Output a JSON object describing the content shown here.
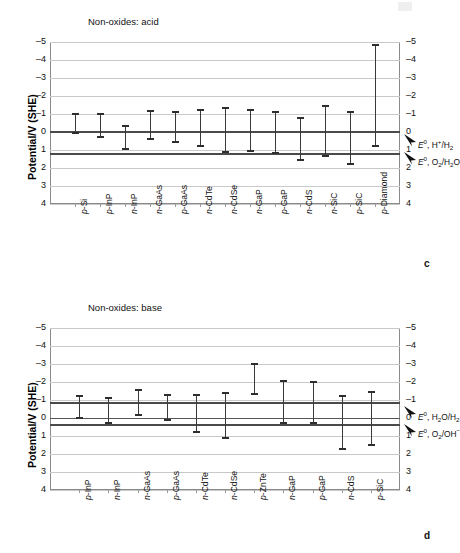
{
  "figure": {
    "panels": [
      "c",
      "d"
    ]
  },
  "panel_c": {
    "letter": "c",
    "title": "Non-oxides: acid",
    "ylabel": "Potential/V (SHE)",
    "annotations": [
      {
        "name": "h-plus-h2",
        "text": "E0, H+/H2"
      },
      {
        "name": "o2-h2o",
        "text": "E0, O2/H2O"
      }
    ]
  },
  "panel_d": {
    "letter": "d",
    "title": "Non-oxides: base",
    "ylabel": "Potential/V (SHE)",
    "annotations": [
      {
        "name": "h2o-h2",
        "text": "E0, H2O/H2"
      },
      {
        "name": "o2-oh",
        "text": "E0, O2/OH-"
      }
    ]
  },
  "chart_data": [
    {
      "type": "bar",
      "name": "non-oxides-acid",
      "title": "Non-oxides: acid",
      "xlabel": "",
      "ylabel": "Potential/V (SHE)",
      "ylim": [
        -5,
        4
      ],
      "y_inverted": true,
      "yticks": [
        -5,
        -4,
        -3,
        -2,
        -1,
        0,
        1,
        2,
        3,
        4
      ],
      "ytick_labels": [
        "–5",
        "–4",
        "–3",
        "–2",
        "–1",
        "0",
        "1",
        "2",
        "3",
        "4"
      ],
      "grid": true,
      "legend": false,
      "categories": [
        "p-Si",
        "p-InP",
        "n-InP",
        "n-GaAs",
        "p-GaAs",
        "n-CdTe",
        "n-CdSe",
        "n-GaP",
        "p-GaP",
        "n-CdS",
        "n-SiC",
        "p-SiC",
        "p-Diamond"
      ],
      "category_prefixes": [
        "p",
        "p",
        "n",
        "n",
        "p",
        "n",
        "n",
        "n",
        "p",
        "n",
        "n",
        "p",
        "p"
      ],
      "category_stems": [
        "Si",
        "InP",
        "InP",
        "GaAs",
        "GaAs",
        "CdTe",
        "CdSe",
        "GaP",
        "GaP",
        "CdS",
        "SiC",
        "SiC",
        "Diamond"
      ],
      "series": [
        {
          "name": "conduction band edge (top of bar)",
          "values": [
            -1.0,
            -1.0,
            -0.35,
            -1.15,
            -1.1,
            -1.25,
            -1.35,
            -1.2,
            -1.1,
            -0.8,
            -1.45,
            -1.1,
            -4.85
          ]
        },
        {
          "name": "valence band edge (bottom of bar)",
          "values": [
            0.05,
            0.3,
            0.95,
            0.4,
            0.55,
            0.8,
            1.1,
            1.05,
            1.15,
            1.55,
            1.35,
            1.8,
            0.75
          ]
        }
      ],
      "reference_lines": [
        {
          "name": "h-plus-h2",
          "label": "E0, H+/H2",
          "value": 0.0
        },
        {
          "name": "o2-h2o",
          "label": "E0, O2/H2O",
          "value": 1.23
        }
      ]
    },
    {
      "type": "bar",
      "name": "non-oxides-base",
      "title": "Non-oxides: base",
      "xlabel": "",
      "ylabel": "Potential/V (SHE)",
      "ylim": [
        -5,
        4
      ],
      "y_inverted": true,
      "yticks": [
        -5,
        -4,
        -3,
        -2,
        -1,
        0,
        1,
        2,
        3,
        4
      ],
      "ytick_labels": [
        "–5",
        "–4",
        "–3",
        "–2",
        "–1",
        "0",
        "1",
        "2",
        "3",
        "4"
      ],
      "grid": true,
      "legend": false,
      "categories": [
        "p-InP",
        "n-InP",
        "n-GaAs",
        "p-GaAs",
        "n-CdTe",
        "n-CdSe",
        "p-ZnTe",
        "n-GaP",
        "p-GaP",
        "n-CdS",
        "p-SiC"
      ],
      "category_prefixes": [
        "p",
        "n",
        "n",
        "p",
        "n",
        "n",
        "p",
        "n",
        "p",
        "n",
        "p"
      ],
      "category_stems": [
        "InP",
        "InP",
        "GaAs",
        "GaAs",
        "CdTe",
        "CdSe",
        "ZnTe",
        "GaP",
        "GaP",
        "CdS",
        "SiC"
      ],
      "series": [
        {
          "name": "conduction band edge (top of bar)",
          "values": [
            -1.2,
            -1.1,
            -1.55,
            -1.3,
            -1.3,
            -1.4,
            -3.0,
            -2.05,
            -2.0,
            -1.25,
            -1.45
          ]
        },
        {
          "name": "valence band edge (bottom of bar)",
          "values": [
            0.0,
            0.3,
            -0.15,
            0.1,
            0.8,
            1.1,
            -1.35,
            0.25,
            0.3,
            1.7,
            1.5
          ]
        }
      ],
      "reference_lines": [
        {
          "name": "h2o-h2",
          "label": "E0, H2O/H2",
          "value": -0.83
        },
        {
          "name": "o2-oh",
          "label": "E0, O2/OH-",
          "value": 0.4
        }
      ]
    }
  ]
}
